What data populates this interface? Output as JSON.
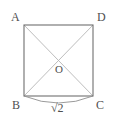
{
  "figure": {
    "shape": "square",
    "colors": {
      "background": "#ffffff",
      "outline": "#6b6b6b",
      "diagonal": "#b3b3b3",
      "arc": "#8c8c8c",
      "text": "#4f4f4f"
    },
    "square": {
      "x": 24,
      "y": 25,
      "width": 69,
      "height": 71
    },
    "vertices": [
      {
        "name": "A",
        "label": "A",
        "position": "top-left",
        "x": 24,
        "y": 25
      },
      {
        "name": "D",
        "label": "D",
        "position": "top-right",
        "x": 93,
        "y": 25
      },
      {
        "name": "B",
        "label": "B",
        "position": "bottom-left",
        "x": 24,
        "y": 96
      },
      {
        "name": "C",
        "label": "C",
        "position": "bottom-right",
        "x": 93,
        "y": 96
      }
    ],
    "center": {
      "name": "O",
      "label": "O",
      "x": 58,
      "y": 60
    },
    "diagonals": [
      {
        "from": "A",
        "to": "C"
      },
      {
        "from": "D",
        "to": "B"
      }
    ],
    "measurement": {
      "label": "√2",
      "plain": "sqrt(2)",
      "edge_from": "B",
      "edge_to": "C",
      "arc_depth": 7
    }
  }
}
